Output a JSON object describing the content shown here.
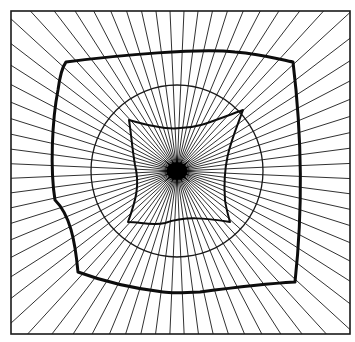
{
  "diagram": {
    "canvas": {
      "width": 355,
      "height": 342,
      "background": "#ffffff",
      "ink": "#1a1a1a"
    },
    "border": {
      "x": 11,
      "y": 11,
      "width": 339,
      "height": 323
    },
    "center": {
      "x": 177,
      "y": 171
    },
    "rays": {
      "count": 72,
      "start_angle_deg": 2.5
    },
    "circle": {
      "r": 86
    },
    "outer_contour": {
      "description": "thick rounded-square closed curve",
      "path": "M66,62 C120,55 200,48 235,52 C262,54 282,60 293,62 C300,120 304,200 295,282 C260,284 230,288 200,292 C180,293 170,293 163,292 C130,288 105,282 78,272 C75,240 70,215 55,200 C50,170 52,120 58,90 C60,75 63,66 66,62 Z"
    },
    "inner_contour": {
      "description": "thin four-pointed concave star curve",
      "path": "M129,120 C150,126 168,130 180,128 C198,128 210,122 243,110 C232,140 222,160 225,200 C226,208 228,215 230,222 C205,218 185,216 165,223 C152,226 140,222 128,222 C136,200 140,185 135,165 C132,148 131,132 129,120 Z"
    },
    "center_blot": {
      "rx": 15,
      "ry": 13
    }
  }
}
